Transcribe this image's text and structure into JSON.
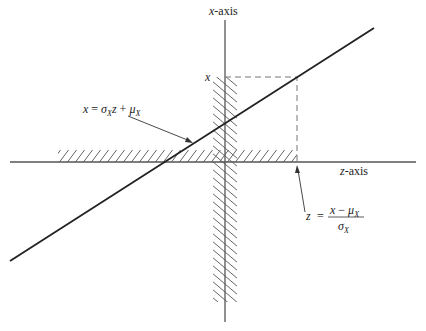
{
  "diagram": {
    "axes": {
      "vertical_label": "x-axis",
      "vertical_label_var": "x",
      "vertical_label_rest": "-axis",
      "horizontal_label_var": "z",
      "horizontal_label_rest": "-axis"
    },
    "tick_label_x": "x",
    "line_equation": {
      "lhs": "x",
      "eq": "=",
      "sigma": "σ",
      "sub": "X",
      "z": "z",
      "plus": "+",
      "mu": "μ",
      "mu_sub": "X"
    },
    "transform_equation": {
      "lhs": "z",
      "eq": "=",
      "numerator_x": "x",
      "minus": "−",
      "mu": "μ",
      "mu_sub": "X",
      "denominator_sigma": "σ",
      "denominator_sub": "X"
    },
    "colors": {
      "line": "#222222",
      "axis": "#555555",
      "hatch": "#666666",
      "dash": "#777777"
    }
  }
}
